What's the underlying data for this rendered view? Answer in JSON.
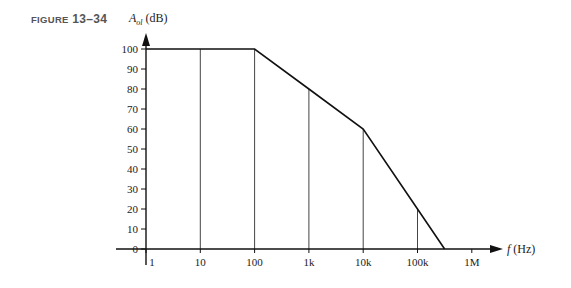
{
  "figure": {
    "label_prefix": "Figure",
    "label_number": "13–34"
  },
  "chart_data": {
    "type": "line",
    "title": "",
    "xlabel": "f (Hz)",
    "ylabel": "A_ol (dB)",
    "xscale": "log",
    "x_tick_labels": [
      "1",
      "10",
      "100",
      "1k",
      "10k",
      "100k",
      "1M"
    ],
    "x_tick_values": [
      1,
      10,
      100,
      1000,
      10000,
      100000,
      1000000
    ],
    "y_tick_labels": [
      "0",
      "10",
      "20",
      "30",
      "40",
      "50",
      "60",
      "70",
      "80",
      "90",
      "100"
    ],
    "ylim": [
      0,
      100
    ],
    "xlim": [
      1,
      1000000
    ],
    "grid": "vertical drop lines at 10, 100, 1k, 10k, 100k",
    "legend": null,
    "series": [
      {
        "name": "Open-loop gain (Bode plot)",
        "x": [
          1,
          100,
          1000,
          10000,
          100000,
          316000
        ],
        "y": [
          100,
          100,
          80,
          60,
          20,
          0
        ]
      }
    ]
  }
}
